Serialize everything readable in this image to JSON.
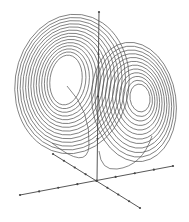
{
  "chart_data": {
    "type": "line",
    "title": "",
    "subtitle": "",
    "xlabel": "",
    "ylabel": "",
    "zlabel": "",
    "grid": false,
    "legend": null,
    "axes": {
      "origin_px": [
        97,
        181
      ],
      "z_axis": {
        "from_px": [
          97,
          181
        ],
        "to_px": [
          99,
          12
        ],
        "ticks": 4
      },
      "x_axis": {
        "from_px": [
          20,
          195
        ],
        "to_px": [
          173,
          166
        ],
        "ticks": 8
      },
      "y_axis": {
        "from_px": [
          53,
          154
        ],
        "to_px": [
          140,
          208
        ],
        "ticks": 8
      }
    },
    "series": [
      {
        "name": "trajectory",
        "color": "#555555",
        "left_lobe": {
          "center_px": [
            66,
            80
          ],
          "rx_max": 57,
          "ry_max": 70,
          "rx_min": 16,
          "ry_min": 25,
          "loops": 14
        },
        "right_lobe": {
          "center_px": [
            140,
            98
          ],
          "rx_max": 42,
          "ry_max": 60,
          "rx_min": 10,
          "ry_min": 14,
          "loops": 12
        }
      }
    ]
  },
  "colors": {
    "line": "#555555",
    "axis": "#444444",
    "background": "#ffffff"
  }
}
